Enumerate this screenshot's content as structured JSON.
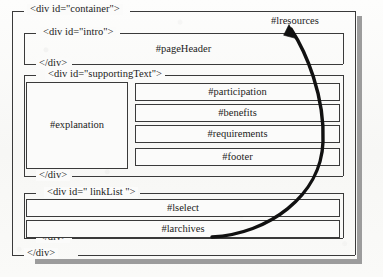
{
  "diagram": {
    "type": "html-div-structure-diagram",
    "title_tags": {
      "container_open": "<div id=\"container\">",
      "container_close": "</div>",
      "intro_open": "<div id=\"intro\">",
      "intro_close": "</div>",
      "supporting_open": "<div id=\"supportingText\">",
      "supporting_close": "</div>",
      "linklist_open": "<div id=\" linkList \">",
      "linklist_close": "</div>"
    },
    "boxes": {
      "page_header": "#pageHeader",
      "explanation": "#explanation",
      "participation": "#participation",
      "benefits": "#benefits",
      "requirements": "#requirements",
      "footer": "#footer",
      "lselect": "#lselect",
      "larchives": "#larchives"
    },
    "annotation": {
      "callout_label": "#lresources",
      "arrow_from": "#larchives row, right side",
      "arrow_to": "#lresources label"
    },
    "colors": {
      "ink": "#1b1b1b",
      "line": "#3a3a3a",
      "paper": "#fbfbfa",
      "shadow": "#9c9c9c",
      "arrow": "#111111"
    }
  }
}
